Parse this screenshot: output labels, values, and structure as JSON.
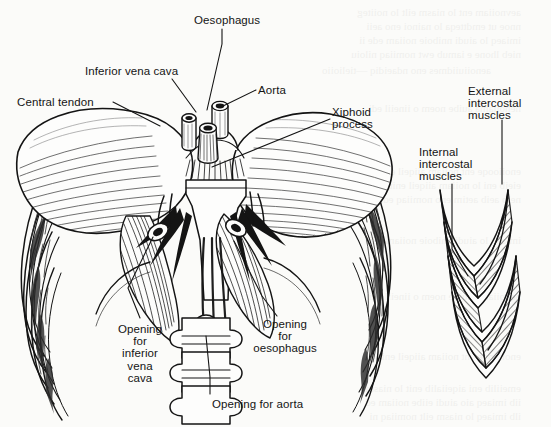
{
  "figure": {
    "background_color": "#fbfbf9",
    "ink_color": "#141414"
  },
  "labels": [
    {
      "id": "oesophagus",
      "text": "Oesophagus",
      "x": 194,
      "y": 14,
      "align": "left"
    },
    {
      "id": "inferior-vena-cava",
      "text": "Inferior vena cava",
      "x": 85,
      "y": 65,
      "align": "left"
    },
    {
      "id": "aorta",
      "text": "Aorta",
      "x": 258,
      "y": 84,
      "align": "left"
    },
    {
      "id": "central-tendon",
      "text": "Central tendon",
      "x": 17,
      "y": 96,
      "align": "left"
    },
    {
      "id": "xiphoid-process",
      "text": "Xiphoid\nprocess",
      "x": 332,
      "y": 106,
      "align": "left"
    },
    {
      "id": "external-intercostal",
      "text": "External\nintercostal\nmuscles",
      "x": 468,
      "y": 85,
      "align": "left"
    },
    {
      "id": "internal-intercostal",
      "text": "Internal\nintercostal\nmuscles",
      "x": 419,
      "y": 146,
      "align": "left"
    },
    {
      "id": "opening-inferior-vena-cava",
      "text": "Opening\nfor\ninferior\nvena\ncava",
      "x": 140,
      "y": 323,
      "align": "center"
    },
    {
      "id": "opening-oesophagus",
      "text": "Opening\nfor\noesophagus",
      "x": 285,
      "y": 318,
      "align": "center"
    },
    {
      "id": "opening-aorta",
      "text": "Opening for aorta",
      "x": 212,
      "y": 398,
      "align": "left"
    }
  ],
  "leaders": [
    {
      "id": "leader-oesophagus",
      "points": "222,29 222,44 207,110"
    },
    {
      "id": "leader-inferior-vena-cava",
      "points": "172,79 196,112"
    },
    {
      "id": "leader-aorta",
      "points": "256,90 221,107"
    },
    {
      "id": "leader-central-tendon",
      "points": "113,102 160,126"
    },
    {
      "id": "leader-xiphoid-process",
      "points": "330,119 212,167"
    },
    {
      "id": "leader-external-intercostal",
      "points": "502,120 502,184"
    },
    {
      "id": "leader-internal-intercostal",
      "points": "452,184 452,249 468,276"
    },
    {
      "id": "leader-opening-ivc",
      "points": "140,318 128,288 153,237"
    },
    {
      "id": "leader-opening-oesophagus",
      "points": "277,316 262,296 234,241"
    },
    {
      "id": "leader-opening-aorta",
      "points": "210,394 210,377 206,336"
    }
  ],
  "structures": [
    {
      "id": "rib-cage-left",
      "name": "left-ribcage"
    },
    {
      "id": "rib-cage-right",
      "name": "right-ribcage"
    },
    {
      "id": "central-tendon-dome",
      "name": "central-tendon"
    },
    {
      "id": "vessel-stumps",
      "name": "vessel-stumps"
    },
    {
      "id": "crura",
      "name": "diaphragm-crura"
    },
    {
      "id": "vertebrae",
      "name": "lumbar-vertebrae"
    },
    {
      "id": "intercostal-detail",
      "name": "intercostal-muscle-detail"
    }
  ]
}
